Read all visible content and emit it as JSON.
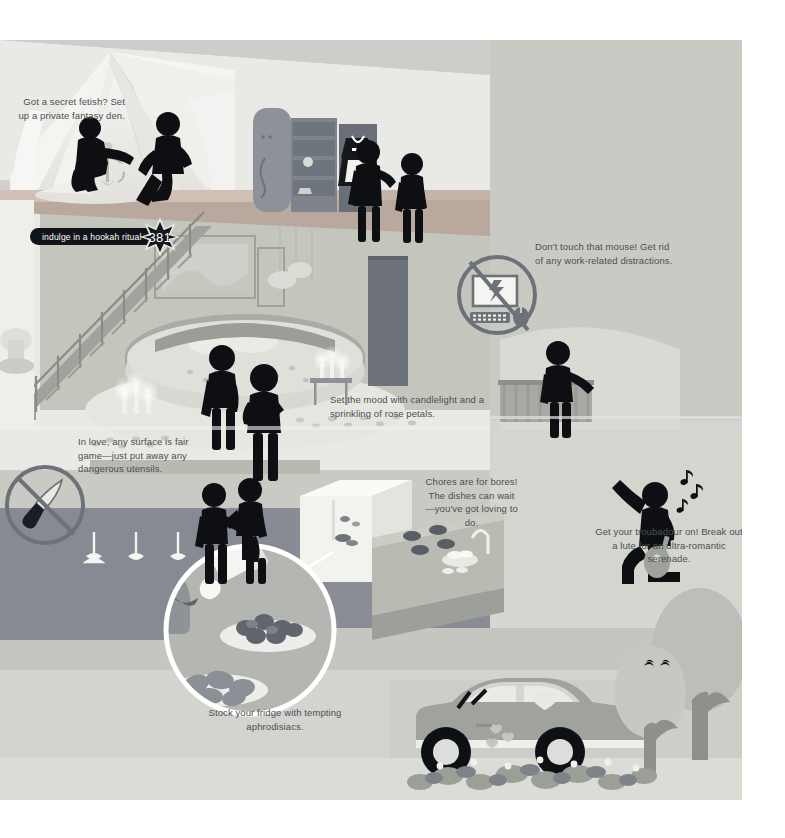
{
  "illustration": {
    "title": "Romantic home makeover infographic",
    "badge": {
      "label": "indulge in a hookah ritual",
      "number": "381"
    },
    "captions": [
      {
        "id": "fantasy-den",
        "text": "Got a secret fetish? Set up a private fantasy den."
      },
      {
        "id": "no-computer",
        "text": "Don't touch that mouse! Get rid of any work-related distractions."
      },
      {
        "id": "candlelight",
        "text": "Set the mood with candlelight and a sprinkling of rose petals."
      },
      {
        "id": "no-utensils",
        "text": "In love, any surface is fair game—just put away any dangerous utensils."
      },
      {
        "id": "chores",
        "text": "Chores are for bores! The dishes can wait—you've got loving to do."
      },
      {
        "id": "troubadour",
        "text": "Get your troubadour on! Break out a lute for an ultra-romantic serenade."
      },
      {
        "id": "fridge",
        "text": "Stock your fridge with tempting aphrodisiacs."
      }
    ],
    "icons": [
      {
        "id": "no-computer-icon",
        "label": "prohibited computer and mouse"
      },
      {
        "id": "no-knife-icon",
        "label": "prohibited kitchen knife"
      },
      {
        "id": "magnifier-icon",
        "label": "magnified fridge contents"
      }
    ],
    "colors": {
      "sky": "#d9dad5",
      "wall_light": "#e8e7e2",
      "wall_mid": "#c9cac3",
      "wall_warm": "#c2bdb0",
      "floor_dark": "#8d9098",
      "floor_mid": "#a9aca9",
      "accent_red": "#b5564f",
      "figure": "#0d0f12",
      "ink": "#4b4f52",
      "white": "#ffffff"
    }
  }
}
